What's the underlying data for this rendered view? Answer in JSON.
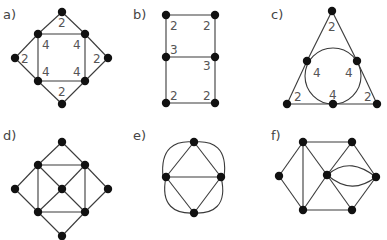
{
  "panels": [
    {
      "id": "a",
      "label": "a)",
      "label_pos": [
        3,
        19
      ],
      "nodes": [
        [
          62,
          12
        ],
        [
          38,
          34
        ],
        [
          85,
          34
        ],
        [
          15,
          58
        ],
        [
          108,
          58
        ],
        [
          38,
          81
        ],
        [
          85,
          81
        ],
        [
          62,
          104
        ]
      ],
      "edges": [
        [
          0,
          1
        ],
        [
          0,
          2
        ],
        [
          1,
          2
        ],
        [
          1,
          3
        ],
        [
          1,
          5
        ],
        [
          2,
          4
        ],
        [
          2,
          6
        ],
        [
          3,
          5
        ],
        [
          4,
          6
        ],
        [
          5,
          6
        ],
        [
          5,
          7
        ],
        [
          6,
          7
        ]
      ],
      "curves": [],
      "circles": [],
      "weights": [
        {
          "text": "2",
          "x": 58,
          "y": 27
        },
        {
          "text": "4",
          "x": 42,
          "y": 49
        },
        {
          "text": "4",
          "x": 73,
          "y": 49
        },
        {
          "text": "2",
          "x": 21,
          "y": 63
        },
        {
          "text": "2",
          "x": 93,
          "y": 63
        },
        {
          "text": "4",
          "x": 42,
          "y": 76
        },
        {
          "text": "4",
          "x": 73,
          "y": 76
        },
        {
          "text": "2",
          "x": 58,
          "y": 96
        }
      ]
    },
    {
      "id": "b",
      "label": "b)",
      "label_pos": [
        133,
        19
      ],
      "nodes": [
        [
          166,
          15
        ],
        [
          215,
          15
        ],
        [
          166,
          57
        ],
        [
          215,
          57
        ],
        [
          166,
          103
        ],
        [
          215,
          103
        ]
      ],
      "edges": [
        [
          0,
          1
        ],
        [
          0,
          2
        ],
        [
          1,
          3
        ],
        [
          2,
          3
        ],
        [
          2,
          4
        ],
        [
          3,
          5
        ],
        [
          4,
          5
        ]
      ],
      "curves": [],
      "circles": [],
      "weights": [
        {
          "text": "2",
          "x": 170,
          "y": 30
        },
        {
          "text": "2",
          "x": 203,
          "y": 30
        },
        {
          "text": "3",
          "x": 170,
          "y": 54
        },
        {
          "text": "3",
          "x": 203,
          "y": 70
        },
        {
          "text": "2",
          "x": 170,
          "y": 100
        },
        {
          "text": "2",
          "x": 203,
          "y": 100
        }
      ]
    },
    {
      "id": "c",
      "label": "c)",
      "label_pos": [
        271,
        19
      ],
      "nodes": [
        [
          332,
          11
        ],
        [
          307,
          61
        ],
        [
          357,
          61
        ],
        [
          287,
          104
        ],
        [
          333,
          104
        ],
        [
          377,
          104
        ]
      ],
      "edges": [
        [
          0,
          1
        ],
        [
          0,
          2
        ],
        [
          1,
          3
        ],
        [
          2,
          5
        ],
        [
          3,
          4
        ],
        [
          4,
          5
        ]
      ],
      "curves": [],
      "circles": [
        {
          "cx": 333,
          "cy": 76,
          "r": 28
        }
      ],
      "weights": [
        {
          "text": "2",
          "x": 328,
          "y": 31
        },
        {
          "text": "4",
          "x": 313,
          "y": 77
        },
        {
          "text": "4",
          "x": 345,
          "y": 77
        },
        {
          "text": "2",
          "x": 294,
          "y": 101
        },
        {
          "text": "4",
          "x": 329,
          "y": 99
        },
        {
          "text": "2",
          "x": 364,
          "y": 101
        }
      ]
    },
    {
      "id": "d",
      "label": "d)",
      "label_pos": [
        3,
        140
      ],
      "nodes": [
        [
          62,
          142
        ],
        [
          38,
          165
        ],
        [
          85,
          165
        ],
        [
          15,
          189
        ],
        [
          62,
          189
        ],
        [
          108,
          189
        ],
        [
          38,
          212
        ],
        [
          85,
          212
        ],
        [
          62,
          236
        ]
      ],
      "edges": [
        [
          0,
          1
        ],
        [
          0,
          2
        ],
        [
          1,
          2
        ],
        [
          1,
          3
        ],
        [
          1,
          6
        ],
        [
          1,
          4
        ],
        [
          2,
          5
        ],
        [
          2,
          7
        ],
        [
          2,
          4
        ],
        [
          3,
          6
        ],
        [
          4,
          6
        ],
        [
          4,
          7
        ],
        [
          5,
          7
        ],
        [
          6,
          7
        ],
        [
          6,
          8
        ],
        [
          7,
          8
        ]
      ],
      "curves": [],
      "circles": [],
      "weights": []
    },
    {
      "id": "e",
      "label": "e)",
      "label_pos": [
        133,
        140
      ],
      "nodes": [
        [
          194,
          142
        ],
        [
          166,
          177
        ],
        [
          221,
          177
        ],
        [
          194,
          213
        ]
      ],
      "edges": [
        [
          0,
          1
        ],
        [
          0,
          2
        ],
        [
          1,
          2
        ],
        [
          1,
          3
        ],
        [
          2,
          3
        ]
      ],
      "curves": [
        "M194,142 C175,140 160,148 163,177",
        "M194,142 C213,140 228,148 224,177",
        "M166,177 C160,206 175,214 194,213",
        "M221,177 C228,206 213,214 194,213"
      ],
      "circles": [],
      "weights": []
    },
    {
      "id": "f",
      "label": "f)",
      "label_pos": [
        271,
        140
      ],
      "nodes": [
        [
          303,
          142
        ],
        [
          352,
          142
        ],
        [
          279,
          176
        ],
        [
          327,
          175
        ],
        [
          376,
          177
        ],
        [
          303,
          210
        ],
        [
          352,
          210
        ]
      ],
      "edges": [
        [
          0,
          1
        ],
        [
          0,
          2
        ],
        [
          0,
          3
        ],
        [
          0,
          5
        ],
        [
          1,
          3
        ],
        [
          1,
          4
        ],
        [
          2,
          5
        ],
        [
          3,
          5
        ],
        [
          3,
          6
        ],
        [
          4,
          6
        ],
        [
          5,
          6
        ]
      ],
      "curves": [
        "M327,175 C345,160 360,165 376,177",
        "M327,175 C345,190 360,189 376,177"
      ],
      "circles": [],
      "weights": []
    }
  ]
}
